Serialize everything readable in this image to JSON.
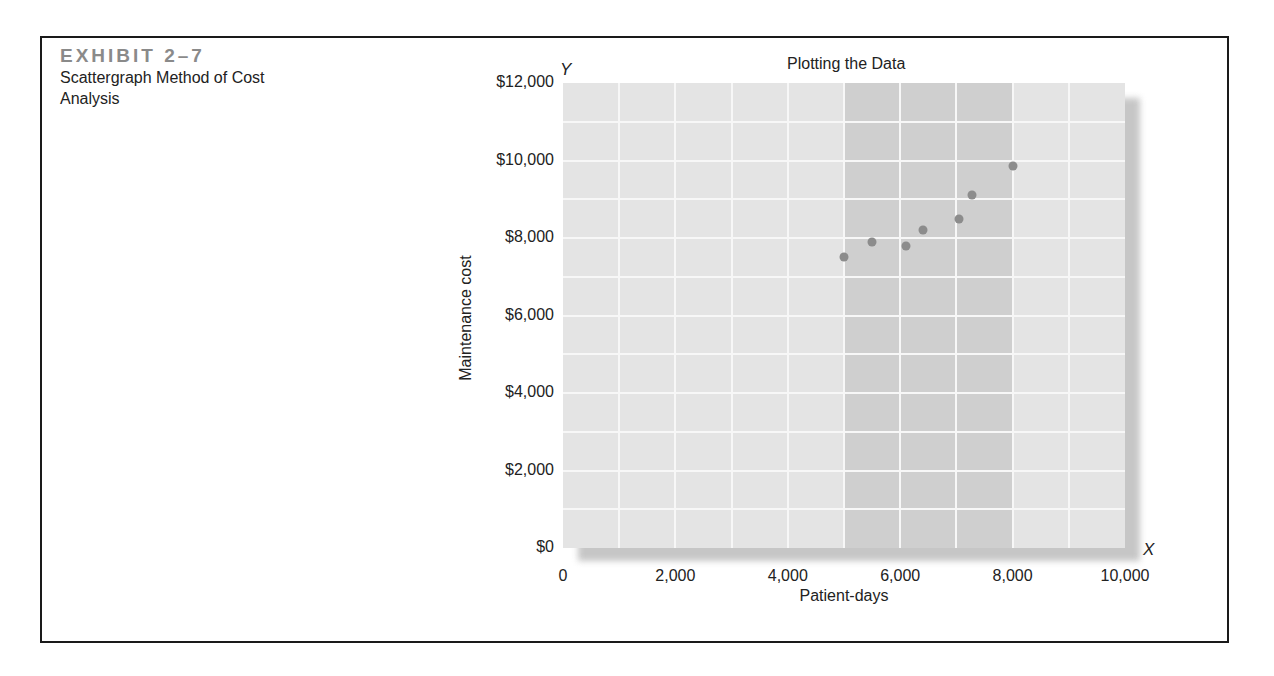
{
  "exhibit": {
    "number": "EXHIBIT 2–7",
    "title": "Scattergraph Method of Cost Analysis"
  },
  "chart_data": {
    "type": "scatter",
    "title": "Plotting the Data",
    "xlabel": "Patient-days",
    "ylabel": "Maintenance cost",
    "x_axis_marker": "X",
    "y_axis_marker": "Y",
    "xlim": [
      0,
      10000
    ],
    "ylim": [
      0,
      12000
    ],
    "x_ticks": [
      "0",
      "2,000",
      "4,000",
      "6,000",
      "8,000",
      "10,000"
    ],
    "y_ticks": [
      "$0",
      "$2,000",
      "$4,000",
      "$6,000",
      "$8,000",
      "$10,000",
      "$12,000"
    ],
    "grid": true,
    "grid_step_x": 1000,
    "grid_step_y": 1000,
    "highlight_band_x": [
      5000,
      8000
    ],
    "points": [
      {
        "x": 5000,
        "y": 7500
      },
      {
        "x": 5500,
        "y": 7900
      },
      {
        "x": 6100,
        "y": 7800
      },
      {
        "x": 6400,
        "y": 8200
      },
      {
        "x": 7050,
        "y": 8500
      },
      {
        "x": 7270,
        "y": 9100
      },
      {
        "x": 8000,
        "y": 9850
      }
    ],
    "colors": {
      "plot_background": "#e4e4e4",
      "highlight_band": "#cfcfcf",
      "gridlines": "#f7f7f7",
      "points": "#8c8c8c"
    }
  }
}
